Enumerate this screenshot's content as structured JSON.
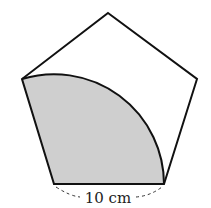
{
  "diagram": {
    "shape": "regular pentagon",
    "shaded_region": "sector centered at bottom-left vertex, from bottom-right vertex to left vertex",
    "side_label": "10 cm",
    "colors": {
      "stroke": "#111111",
      "shade": "#cfcfcf",
      "background": "#ffffff"
    }
  }
}
